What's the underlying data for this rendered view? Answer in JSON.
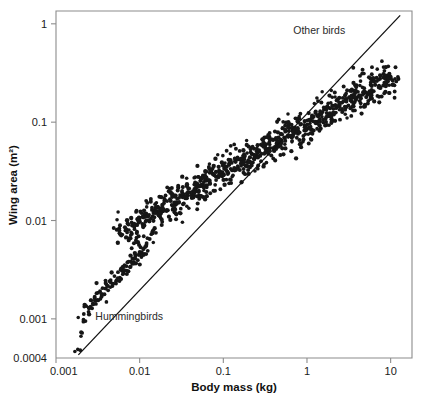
{
  "chart_data": {
    "type": "scatter",
    "title": "",
    "xlabel": "Body mass (kg)",
    "ylabel": "Wing area (m²)",
    "xscale": "log",
    "yscale": "log",
    "xlim": [
      0.001,
      18
    ],
    "ylim": [
      0.0004,
      1.35
    ],
    "grid": false,
    "legend": "none",
    "xticks": [
      {
        "value": 0.001,
        "label": "0.001"
      },
      {
        "value": 0.01,
        "label": "0.01"
      },
      {
        "value": 0.1,
        "label": "0.1"
      },
      {
        "value": 1,
        "label": "1"
      },
      {
        "value": 10,
        "label": "10"
      }
    ],
    "yticks": [
      {
        "value": 1,
        "label": "1"
      },
      {
        "value": 0.1,
        "label": "0.1"
      },
      {
        "value": 0.01,
        "label": "0.01"
      },
      {
        "value": 0.001,
        "label": "0.001"
      },
      {
        "value": 0.0004,
        "label": "0.0004"
      }
    ],
    "annotations": [
      {
        "text": "Other birds",
        "x": 1.4,
        "y": 0.78
      },
      {
        "text": "Hummingbirds",
        "x": 0.0075,
        "y": 0.00097
      }
    ],
    "series": [
      {
        "name": "Hummingbirds",
        "marker": "filled-circle",
        "color": "#161616",
        "points": [
          [
            0.00195,
            0.00048
          ],
          [
            0.00205,
            0.00072
          ],
          [
            0.00215,
            0.00112
          ],
          [
            0.00225,
            0.00095
          ],
          [
            0.0023,
            0.00135
          ],
          [
            0.00245,
            0.00118
          ],
          [
            0.0026,
            0.00155
          ],
          [
            0.0027,
            0.00128
          ],
          [
            0.0029,
            0.00168
          ],
          [
            0.003,
            0.00142
          ],
          [
            0.0032,
            0.00185
          ],
          [
            0.0034,
            0.0016
          ],
          [
            0.0036,
            0.00205
          ],
          [
            0.0038,
            0.00178
          ],
          [
            0.004,
            0.00225
          ],
          [
            0.0042,
            0.00195
          ],
          [
            0.0045,
            0.00248
          ],
          [
            0.0047,
            0.00215
          ],
          [
            0.005,
            0.00272
          ],
          [
            0.0052,
            0.00238
          ],
          [
            0.0055,
            0.00298
          ],
          [
            0.0058,
            0.00262
          ],
          [
            0.006,
            0.00325
          ],
          [
            0.0063,
            0.00285
          ],
          [
            0.0066,
            0.00352
          ],
          [
            0.007,
            0.0031
          ],
          [
            0.0074,
            0.00382
          ],
          [
            0.0078,
            0.00338
          ],
          [
            0.0082,
            0.00412
          ],
          [
            0.0086,
            0.00365
          ],
          [
            0.009,
            0.00445
          ],
          [
            0.0095,
            0.00395
          ],
          [
            0.01,
            0.0048
          ],
          [
            0.0105,
            0.00425
          ],
          [
            0.011,
            0.00515
          ],
          [
            0.0115,
            0.00458
          ],
          [
            0.012,
            0.00552
          ],
          [
            0.0125,
            0.00492
          ]
        ]
      },
      {
        "name": "Other birds",
        "marker": "filled-circle",
        "color": "#161616",
        "points": [
          [
            0.0062,
            0.0072
          ],
          [
            0.007,
            0.0081
          ],
          [
            0.0078,
            0.0066
          ],
          [
            0.0085,
            0.0092
          ],
          [
            0.0093,
            0.0077
          ],
          [
            0.01,
            0.0105
          ],
          [
            0.011,
            0.0088
          ],
          [
            0.012,
            0.0118
          ],
          [
            0.013,
            0.0098
          ],
          [
            0.014,
            0.0128
          ],
          [
            0.015,
            0.0108
          ],
          [
            0.0165,
            0.0138
          ],
          [
            0.018,
            0.0118
          ],
          [
            0.0195,
            0.015
          ],
          [
            0.021,
            0.0128
          ],
          [
            0.023,
            0.0165
          ],
          [
            0.025,
            0.014
          ],
          [
            0.027,
            0.018
          ],
          [
            0.0295,
            0.0152
          ],
          [
            0.032,
            0.0195
          ],
          [
            0.035,
            0.0168
          ],
          [
            0.038,
            0.0212
          ],
          [
            0.0415,
            0.0182
          ],
          [
            0.045,
            0.0232
          ],
          [
            0.049,
            0.0198
          ],
          [
            0.053,
            0.0252
          ],
          [
            0.058,
            0.0218
          ],
          [
            0.063,
            0.0275
          ],
          [
            0.069,
            0.0238
          ],
          [
            0.075,
            0.03
          ],
          [
            0.082,
            0.0258
          ],
          [
            0.089,
            0.0325
          ],
          [
            0.097,
            0.0282
          ],
          [
            0.106,
            0.0355
          ],
          [
            0.115,
            0.0305
          ],
          [
            0.126,
            0.0385
          ],
          [
            0.137,
            0.0332
          ],
          [
            0.149,
            0.042
          ],
          [
            0.163,
            0.036
          ],
          [
            0.178,
            0.0455
          ],
          [
            0.194,
            0.0392
          ],
          [
            0.212,
            0.0495
          ],
          [
            0.231,
            0.0425
          ],
          [
            0.252,
            0.054
          ],
          [
            0.275,
            0.0462
          ],
          [
            0.3,
            0.0585
          ],
          [
            0.327,
            0.0502
          ],
          [
            0.357,
            0.0635
          ],
          [
            0.389,
            0.0545
          ],
          [
            0.425,
            0.069
          ],
          [
            0.463,
            0.0592
          ],
          [
            0.505,
            0.075
          ],
          [
            0.551,
            0.0645
          ],
          [
            0.601,
            0.0815
          ],
          [
            0.655,
            0.07
          ],
          [
            0.715,
            0.0885
          ],
          [
            0.78,
            0.076
          ],
          [
            0.85,
            0.096
          ],
          [
            0.928,
            0.0825
          ],
          [
            1.012,
            0.1045
          ],
          [
            1.104,
            0.0898
          ],
          [
            1.204,
            0.1135
          ],
          [
            1.314,
            0.0975
          ],
          [
            1.433,
            0.1235
          ],
          [
            1.563,
            0.106
          ],
          [
            1.705,
            0.1342
          ],
          [
            1.86,
            0.1152
          ],
          [
            2.029,
            0.1458
          ],
          [
            2.213,
            0.1252
          ],
          [
            2.414,
            0.1585
          ],
          [
            2.633,
            0.1362
          ],
          [
            2.872,
            0.1722
          ],
          [
            3.133,
            0.148
          ],
          [
            3.417,
            0.1872
          ],
          [
            3.727,
            0.1608
          ],
          [
            4.066,
            0.2035
          ],
          [
            4.435,
            0.1748
          ],
          [
            4.838,
            0.2212
          ],
          [
            5.277,
            0.19
          ],
          [
            5.756,
            0.2405
          ],
          [
            6.278,
            0.2065
          ],
          [
            6.848,
            0.2615
          ],
          [
            7.47,
            0.2245
          ],
          [
            8.148,
            0.2842
          ],
          [
            8.888,
            0.2442
          ],
          [
            9.695,
            0.309
          ],
          [
            10.575,
            0.2655
          ]
        ]
      }
    ],
    "fit_line": {
      "label": "power-law fit",
      "x0": 0.00185,
      "y0": 0.00043,
      "x1": 13.0,
      "y1": 1.22
    },
    "total_points": 780
  },
  "axes": {
    "x_title": "Body mass (kg)",
    "y_title": "Wing area (m²)"
  }
}
